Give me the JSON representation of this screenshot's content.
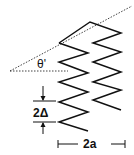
{
  "diagram": {
    "labels": {
      "angle": "θ'",
      "pitch": "2Δ",
      "width": "2a"
    },
    "colors": {
      "line": "#111111",
      "background": "#ffffff"
    },
    "springs": [
      {
        "name": "left-spring",
        "points": "59,43 88,53 59,62 88,73 59,82 88,92 59,102 88,112 59,122 88,131"
      },
      {
        "name": "right-spring",
        "points": "59,43 90,22 121,33 93,43 121,52 93,62 121,72 93,82 121,90 93,100 121,110"
      }
    ]
  }
}
